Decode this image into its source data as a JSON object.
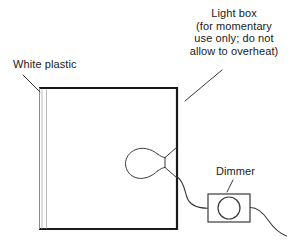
{
  "diagram": {
    "background_color": "#ffffff",
    "line_color": "#1a1a1a",
    "panel_line_color": "#b8b8b8",
    "text_color": "#1a1a1a",
    "width": 290,
    "height": 243
  },
  "labels": {
    "white_plastic": {
      "text": "White plastic",
      "leader": "line from text down-right to top-left corner of light box"
    },
    "light_box": {
      "line1": "Light box",
      "line2": "(for momentary",
      "line3": "use only; do not",
      "line4": "allow to overheat)",
      "leader": "diagonal line from text down-left to top-right corner of light box"
    },
    "dimmer": {
      "text": "Dimmer",
      "leader": "short diagonal line from text down-left to dimmer box"
    }
  },
  "parts": {
    "light_box": {
      "name": "light-box",
      "shape": "rectangle",
      "x": 39,
      "y": 87,
      "width": 138,
      "height": 143
    },
    "white_plastic_panel": {
      "name": "white-plastic-panel",
      "shape": "two vertical lines",
      "x1": 41,
      "x2": 46,
      "top": 89,
      "bottom": 229
    },
    "light_bulb": {
      "name": "light-bulb",
      "shape": "round envelope with conical base",
      "center_x": 145,
      "center_y": 163,
      "radius": 15,
      "base_attach_x": 177
    },
    "dimmer": {
      "name": "dimmer-box",
      "shape": "rectangle with circular knob",
      "x": 208,
      "y": 194,
      "width": 42,
      "height": 28,
      "knob_center_x": 229,
      "knob_center_y": 208,
      "knob_radius": 11
    },
    "wire_bulb_to_dimmer": {
      "name": "wire-bulb-to-dimmer",
      "shape": "s-curve"
    },
    "wire_dimmer_out": {
      "name": "wire-dimmer-output",
      "shape": "curve to bottom right"
    }
  }
}
